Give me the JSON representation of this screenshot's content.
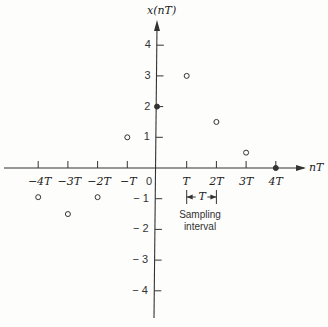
{
  "chart_data": {
    "type": "scatter",
    "title": "",
    "ylabel": "x(nT)",
    "xlabel": "nT",
    "x_categories": [
      "-4T",
      "-3T",
      "-2T",
      "-T",
      "0",
      "T",
      "2T",
      "3T",
      "4T"
    ],
    "x": [
      -4,
      -3,
      -2,
      -1,
      0,
      1,
      2,
      3,
      4
    ],
    "values": [
      -0.95,
      -1.5,
      -0.95,
      1,
      2,
      3,
      1.5,
      0.5,
      0
    ],
    "y_ticks": [
      "4",
      "3",
      "2",
      "1",
      "-1",
      "-2",
      "-3",
      "-4"
    ],
    "ylim": [
      -4.9,
      4.9
    ],
    "xlim": [
      -5,
      5
    ],
    "grid": false,
    "legend": null,
    "annotations": [
      {
        "text": "T",
        "type": "bracket",
        "from": "T",
        "to": "2T"
      },
      {
        "text": "Sampling interval",
        "position": "below bracket"
      }
    ]
  },
  "labels": {
    "y_axis": "x(nT)",
    "x_axis": "nT",
    "origin": "0",
    "bracket": "T",
    "annotation_line1": "Sampling",
    "annotation_line2": "interval"
  }
}
